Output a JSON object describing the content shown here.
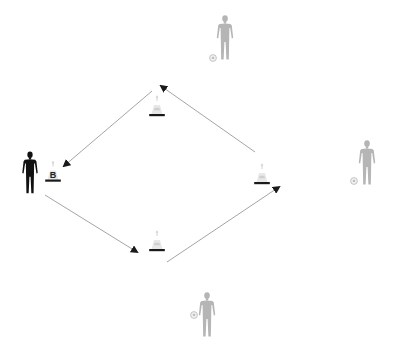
{
  "diagram": {
    "type": "soccer-drill",
    "background": "#ffffff",
    "colors": {
      "active_player": "#111111",
      "inactive_player": "#b5b5b5",
      "cone_body": "#e6e6e6",
      "cone_stripe": "#ffffff",
      "cone_base": "#1a1a1a",
      "arrow_line": "#9a9a9a",
      "arrow_head": "#1a1a1a"
    },
    "active_player": {
      "name": "active-player",
      "x": 30,
      "y": 150
    },
    "cones": [
      {
        "id": "cone-b",
        "label": "B",
        "x": 53,
        "y": 158
      },
      {
        "id": "cone-top",
        "label": "",
        "x": 157,
        "y": 95
      },
      {
        "id": "cone-right",
        "label": "",
        "x": 262,
        "y": 163
      },
      {
        "id": "cone-bottom",
        "label": "",
        "x": 157,
        "y": 230
      }
    ],
    "server_players": [
      {
        "id": "server-top",
        "x": 225,
        "y": 15,
        "ball_x": 213,
        "ball_y": 58
      },
      {
        "id": "server-right",
        "x": 367,
        "y": 140,
        "ball_x": 354,
        "ball_y": 181
      },
      {
        "id": "server-bottom",
        "x": 207,
        "y": 292,
        "ball_x": 194,
        "ball_y": 315
      }
    ],
    "arrows": [
      {
        "id": "arrow-top-to-b",
        "x1": 152,
        "y1": 91,
        "x2": 64,
        "y2": 166
      },
      {
        "id": "arrow-b-to-bottom",
        "x1": 45,
        "y1": 195,
        "x2": 137,
        "y2": 252
      },
      {
        "id": "arrow-bottom-to-right",
        "x1": 167,
        "y1": 262,
        "x2": 279,
        "y2": 187
      },
      {
        "id": "arrow-right-to-top",
        "x1": 255,
        "y1": 152,
        "x2": 161,
        "y2": 86
      }
    ]
  }
}
